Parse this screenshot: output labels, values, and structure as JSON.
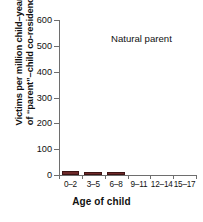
{
  "chart_data": {
    "type": "bar",
    "title": "",
    "annotation": "Natural parent",
    "categories": [
      "0–2",
      "3–5",
      "6–8",
      "9–11",
      "12–14",
      "15–17"
    ],
    "values": [
      14,
      11,
      10,
      0,
      0,
      0
    ],
    "xlabel": "Age of child",
    "ylabel_line1": "Victims per million child–years",
    "ylabel_line2": "of “parent”–child co-residence",
    "ylim": [
      0,
      600
    ],
    "yticks": [
      0,
      100,
      200,
      300,
      400,
      500,
      600
    ],
    "ytick_labels": [
      "0",
      "100",
      "200",
      "300",
      "400",
      "500",
      "600"
    ],
    "grid": false,
    "legend": "none",
    "bar_color": "#6e2a2a",
    "bar_edge_color": "#3d1414",
    "axis_color": "#6e6e6e",
    "text_color": "#111111",
    "background": "#ffffff"
  }
}
